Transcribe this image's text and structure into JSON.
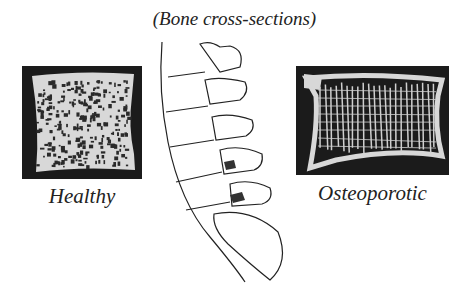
{
  "title": "(Bone cross-sections)",
  "panels": {
    "healthy": {
      "label": "Healthy"
    },
    "osteoporotic": {
      "label": "Osteoporotic"
    }
  },
  "icons": {
    "spine": "lumbar-spine-illustration"
  },
  "colors": {
    "background": "#ffffff",
    "photo_background": "#1b1b1b",
    "bone": "#e8e8e8",
    "ink": "#222222"
  }
}
